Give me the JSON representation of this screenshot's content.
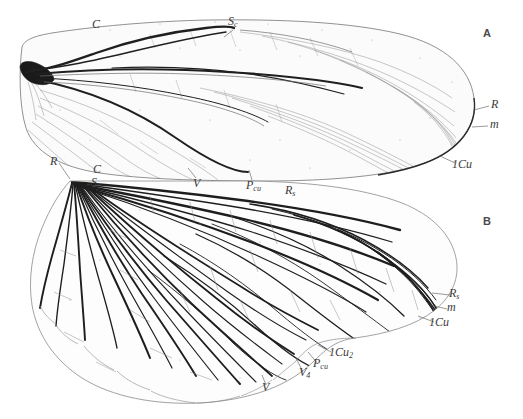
{
  "figure": {
    "background_color": "#ffffff",
    "ink_color": "#2b2b2b",
    "faint_ink_color": "#8c8c8c",
    "width": 523,
    "height": 419
  },
  "panels": [
    {
      "id": "A",
      "label": "A",
      "x": 483,
      "y": 28,
      "description": "forewing, upper"
    },
    {
      "id": "B",
      "label": "B",
      "x": 483,
      "y": 216,
      "description": "hind wing, fan-shaped, lower"
    }
  ],
  "labels": [
    {
      "name": "label-a-c",
      "panel": "A",
      "text": "C",
      "sub": "",
      "x": 92,
      "y": 18
    },
    {
      "name": "label-a-sc",
      "panel": "A",
      "text": "S",
      "sub": "c",
      "x": 228,
      "y": 15
    },
    {
      "name": "label-a-r",
      "panel": "A",
      "text": "R",
      "sub": "",
      "x": 491,
      "y": 98
    },
    {
      "name": "label-a-m",
      "panel": "A",
      "text": "m",
      "sub": "",
      "x": 490,
      "y": 118
    },
    {
      "name": "label-a-1cu",
      "panel": "A",
      "text": "1Cu",
      "sub": "",
      "x": 452,
      "y": 158
    },
    {
      "name": "label-a-pcu",
      "panel": "A",
      "text": "P",
      "sub": "cu",
      "x": 246,
      "y": 179
    },
    {
      "name": "label-a-v",
      "panel": "A",
      "text": "V",
      "sub": "",
      "x": 193,
      "y": 177
    },
    {
      "name": "label-b-r",
      "panel": "B",
      "text": "R",
      "sub": "",
      "x": 50,
      "y": 155
    },
    {
      "name": "label-b-c",
      "panel": "B",
      "text": "C",
      "sub": "",
      "x": 93,
      "y": 163
    },
    {
      "name": "label-b-sc",
      "panel": "B",
      "text": "S",
      "sub": "c",
      "x": 91,
      "y": 176
    },
    {
      "name": "label-b-rs",
      "panel": "B",
      "text": "R",
      "sub": "s",
      "x": 285,
      "y": 184
    },
    {
      "name": "label-b-rs2",
      "panel": "B",
      "text": "R",
      "sub": "s",
      "x": 449,
      "y": 287
    },
    {
      "name": "label-b-m",
      "panel": "B",
      "text": "m",
      "sub": "",
      "x": 447,
      "y": 301
    },
    {
      "name": "label-b-1cu",
      "panel": "B",
      "text": "1Cu",
      "sub": "",
      "x": 429,
      "y": 316
    },
    {
      "name": "label-b-1cu2",
      "panel": "B",
      "text": "1Cu",
      "sub": "2",
      "x": 329,
      "y": 346
    },
    {
      "name": "label-b-pcu",
      "panel": "B",
      "text": "P",
      "sub": "cu",
      "x": 313,
      "y": 357
    },
    {
      "name": "label-b-v4",
      "panel": "B",
      "text": "V",
      "sub": "4",
      "x": 299,
      "y": 366
    },
    {
      "name": "label-b-v",
      "panel": "B",
      "text": "V",
      "sub": "",
      "x": 262,
      "y": 381
    }
  ],
  "leaders": [
    {
      "name": "leader-a-sc",
      "from": [
        233,
        30
      ],
      "to": [
        224,
        37
      ]
    },
    {
      "name": "leader-a-r",
      "from": [
        489,
        106
      ],
      "to": [
        474,
        110
      ]
    },
    {
      "name": "leader-a-m",
      "from": [
        488,
        126
      ],
      "to": [
        472,
        127
      ]
    },
    {
      "name": "leader-a-1cu",
      "from": [
        455,
        163
      ],
      "to": [
        440,
        156
      ]
    },
    {
      "name": "leader-a-pcu",
      "from": [
        252,
        180
      ],
      "to": [
        249,
        170
      ]
    },
    {
      "name": "leader-a-v",
      "from": [
        196,
        178
      ],
      "to": [
        188,
        168
      ]
    },
    {
      "name": "leader-b-r",
      "from": [
        59,
        163
      ],
      "to": [
        70,
        179
      ]
    },
    {
      "name": "leader-b-rs2",
      "from": [
        450,
        295
      ],
      "to": [
        432,
        293
      ]
    },
    {
      "name": "leader-b-m",
      "from": [
        447,
        309
      ],
      "to": [
        430,
        305
      ]
    },
    {
      "name": "leader-b-1cu",
      "from": [
        434,
        322
      ],
      "to": [
        418,
        316
      ]
    },
    {
      "name": "leader-b-1cu2",
      "from": [
        331,
        352
      ],
      "to": [
        318,
        345
      ]
    },
    {
      "name": "leader-b-pcu",
      "from": [
        318,
        364
      ],
      "to": [
        308,
        352
      ]
    },
    {
      "name": "leader-b-v4",
      "from": [
        303,
        372
      ],
      "to": [
        296,
        358
      ]
    },
    {
      "name": "leader-b-v",
      "from": [
        266,
        385
      ],
      "to": [
        262,
        375
      ]
    }
  ],
  "wing_a": {
    "name": "forewing-outline",
    "outline": "M 22 47 C 24 40 34 36 52 33 C 90 27 150 21 210 20 C 280 19 350 22 400 34 C 445 45 470 68 474 98 C 478 125 460 150 425 163 C 390 176 330 181 265 181 C 200 181 140 179 100 173 C 60 167 34 152 26 128 C 19 106 19 70 22 47 Z",
    "stem": "M 22 60 C 26 58 32 60 38 64 C 44 68 48 73 50 78 C 48 84 42 86 34 84 C 26 82 21 74 20 68 Z",
    "main_veins": [
      {
        "id": "costa",
        "d": "M 24 55 C 60 47 120 37 180 31 C 240 26 310 25 370 31"
      },
      {
        "id": "subcosta",
        "d": "M 30 68 C 70 62 120 50 170 41 C 200 35 222 31 234 29"
      },
      {
        "id": "radius",
        "d": "M 32 70 C 80 66 150 62 215 66 C 270 70 300 76 320 80"
      },
      {
        "id": "rs",
        "d": "M 100 68 C 150 66 210 68 260 74 C 300 79 330 86 352 92"
      },
      {
        "id": "media",
        "d": "M 38 74 C 90 76 150 80 200 88 C 250 96 275 106 288 116"
      },
      {
        "id": "cubitus",
        "d": "M 36 78 C 90 88 140 106 180 130 C 215 150 238 166 250 172"
      }
    ]
  },
  "wing_b": {
    "name": "hindwing-outline",
    "hinge": [
      70,
      181
    ],
    "outline": "M 70 181 C 60 192 50 208 42 228 C 32 252 28 280 32 305 C 37 334 54 360 82 378 C 112 397 155 405 200 403 C 250 400 290 386 315 360 C 330 345 340 340 355 338 C 385 334 415 326 435 310 C 452 296 460 278 456 258 C 451 234 432 215 402 203 C 360 187 300 181 240 181 C 180 181 110 181 70 181 Z"
  },
  "chart_data": {
    "type": "diagram",
    "panels": [
      "A",
      "B"
    ],
    "vein_abbreviations": [
      "C",
      "Sc",
      "R",
      "Rs",
      "m",
      "1Cu",
      "1Cu2",
      "Pcu",
      "V",
      "V4"
    ]
  }
}
